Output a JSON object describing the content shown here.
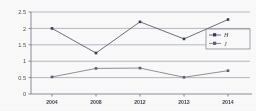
{
  "chart_data": {
    "type": "line",
    "title": "",
    "xlabel": "",
    "ylabel": "",
    "categories": [
      "2004",
      "2008",
      "2012",
      "2013",
      "2014"
    ],
    "ylim": [
      0,
      2.5
    ],
    "yticks": [
      "0",
      "0.5",
      "1",
      "1.5",
      "2",
      "2.5"
    ],
    "ytick_values": [
      0,
      0.5,
      1,
      1.5,
      2,
      2.5
    ],
    "grid": true,
    "legend_position": "right-middle",
    "series": [
      {
        "name": "H",
        "color": "#4a4f72",
        "marker": "square",
        "values": [
          2.0,
          1.25,
          2.2,
          1.68,
          2.27
        ]
      },
      {
        "name": "J",
        "color": "#6e7184",
        "marker": "square",
        "values": [
          0.52,
          0.78,
          0.79,
          0.51,
          0.71
        ]
      }
    ]
  },
  "legend": {
    "entries": [
      {
        "label": "H"
      },
      {
        "label": "J"
      }
    ]
  },
  "axes": {
    "y_tick_labels": [
      "2.5",
      "2",
      "1.5",
      "1",
      "0.5",
      "0"
    ],
    "x_tick_labels": [
      "2004",
      "2008",
      "2012",
      "2013",
      "2014"
    ]
  },
  "colors": {
    "series_a": "#4a4f72",
    "series_b": "#6e7184",
    "grid": "#9a9aa6",
    "axis": "#6d6d78",
    "text": "#3c3c50",
    "background": "#ffffff"
  }
}
